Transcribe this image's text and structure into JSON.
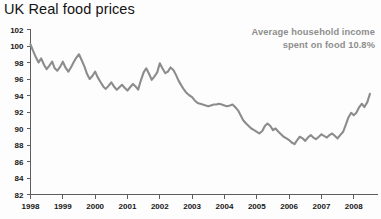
{
  "chart_data": {
    "type": "line",
    "title": "UK Real food prices",
    "xlabel": "",
    "ylabel": "",
    "xlim": [
      1998.0,
      2008.75
    ],
    "ylim": [
      82,
      102
    ],
    "grid": false,
    "legend": null,
    "ytick_labels": [
      "102",
      "100",
      "98",
      "96",
      "94",
      "92",
      "90",
      "88",
      "86",
      "84",
      "82"
    ],
    "ytick_values": [
      102,
      100,
      98,
      96,
      94,
      92,
      90,
      88,
      86,
      84,
      82
    ],
    "xtick_labels": [
      "1998",
      "1999",
      "2000",
      "2001",
      "2002",
      "2003",
      "2004",
      "2005",
      "2006",
      "2007",
      "2008"
    ],
    "xtick_values": [
      1998,
      1999,
      2000,
      2001,
      2002,
      2003,
      2004,
      2005,
      2006,
      2007,
      2008
    ],
    "annotations": [
      {
        "line1": "Average household income",
        "line2": "spent on food 10.8%"
      }
    ],
    "line_color": "#8c8c8c",
    "series": [
      {
        "name": "UK Real food prices index",
        "x": [
          1998.0,
          1998.08,
          1998.17,
          1998.25,
          1998.33,
          1998.42,
          1998.5,
          1998.58,
          1998.67,
          1998.75,
          1998.83,
          1998.92,
          1999.0,
          1999.08,
          1999.17,
          1999.25,
          1999.33,
          1999.42,
          1999.5,
          1999.58,
          1999.67,
          1999.75,
          1999.83,
          1999.92,
          2000.0,
          2000.08,
          2000.17,
          2000.25,
          2000.33,
          2000.42,
          2000.5,
          2000.58,
          2000.67,
          2000.75,
          2000.83,
          2000.92,
          2001.0,
          2001.08,
          2001.17,
          2001.25,
          2001.33,
          2001.42,
          2001.5,
          2001.58,
          2001.67,
          2001.75,
          2001.83,
          2001.92,
          2002.0,
          2002.08,
          2002.17,
          2002.25,
          2002.33,
          2002.42,
          2002.5,
          2002.58,
          2002.67,
          2002.75,
          2002.83,
          2002.92,
          2003.0,
          2003.08,
          2003.17,
          2003.25,
          2003.33,
          2003.42,
          2003.5,
          2003.58,
          2003.67,
          2003.75,
          2003.83,
          2003.92,
          2004.0,
          2004.08,
          2004.17,
          2004.25,
          2004.33,
          2004.42,
          2004.5,
          2004.58,
          2004.67,
          2004.75,
          2004.83,
          2004.92,
          2005.0,
          2005.08,
          2005.17,
          2005.25,
          2005.33,
          2005.42,
          2005.5,
          2005.58,
          2005.67,
          2005.75,
          2005.83,
          2005.92,
          2006.0,
          2006.08,
          2006.17,
          2006.25,
          2006.33,
          2006.42,
          2006.5,
          2006.58,
          2006.67,
          2006.75,
          2006.83,
          2006.92,
          2007.0,
          2007.08,
          2007.17,
          2007.25,
          2007.33,
          2007.42,
          2007.5,
          2007.58,
          2007.67,
          2007.75,
          2007.83,
          2007.92,
          2008.0,
          2008.08,
          2008.17,
          2008.25,
          2008.33,
          2008.42,
          2008.5
        ],
        "values": [
          100.2,
          99.4,
          98.6,
          98.0,
          98.5,
          97.7,
          97.2,
          97.6,
          98.1,
          97.3,
          97.0,
          97.5,
          98.1,
          97.4,
          96.9,
          97.4,
          98.0,
          98.6,
          99.0,
          98.3,
          97.5,
          96.6,
          96.0,
          96.4,
          96.9,
          96.2,
          95.6,
          95.1,
          94.8,
          95.2,
          95.6,
          95.1,
          94.7,
          95.0,
          95.3,
          94.9,
          94.6,
          95.0,
          95.4,
          95.1,
          94.7,
          95.9,
          96.8,
          97.3,
          96.6,
          95.9,
          96.3,
          96.8,
          97.9,
          97.3,
          96.7,
          96.9,
          97.4,
          97.1,
          96.5,
          95.8,
          95.2,
          94.7,
          94.3,
          94.0,
          93.8,
          93.4,
          93.1,
          93.0,
          92.9,
          92.8,
          92.7,
          92.8,
          92.9,
          92.9,
          93.0,
          92.9,
          92.8,
          92.7,
          92.8,
          92.9,
          92.6,
          92.2,
          91.6,
          91.0,
          90.6,
          90.3,
          90.0,
          89.8,
          89.6,
          89.4,
          89.7,
          90.3,
          90.6,
          90.3,
          89.8,
          90.0,
          89.6,
          89.3,
          89.0,
          88.8,
          88.6,
          88.3,
          88.1,
          88.6,
          89.0,
          88.8,
          88.5,
          88.9,
          89.2,
          88.9,
          88.7,
          89.0,
          89.3,
          89.1,
          88.9,
          89.2,
          89.4,
          89.1,
          88.8,
          89.2,
          89.6,
          90.4,
          91.3,
          91.9,
          91.6,
          91.9,
          92.6,
          93.0,
          92.6,
          93.2,
          94.2
        ]
      }
    ]
  },
  "title": "UK Real food prices"
}
